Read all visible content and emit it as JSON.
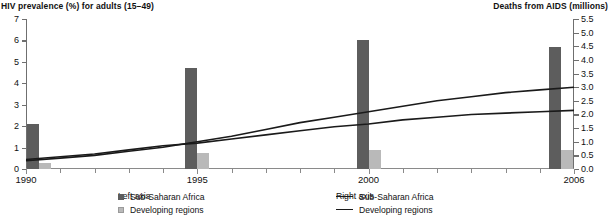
{
  "axes": {
    "left_title": "HIV prevalence (%) for adults (15–49)",
    "right_title": "Deaths from AIDS (millions)",
    "left_ticks": [
      "0",
      "1",
      "2",
      "3",
      "4",
      "5",
      "6",
      "7"
    ],
    "right_ticks": [
      "0.0",
      "0.5",
      "1.0",
      "1.5",
      "2.0",
      "2.5",
      "3.0",
      "3.5",
      "4.0",
      "4.5",
      "5.0",
      "5.5"
    ],
    "x_major_labels": [
      "1990",
      "1995",
      "2000",
      "2006"
    ]
  },
  "legend": {
    "left_heading": "Left axis",
    "right_heading": "Right axis",
    "left_items": [
      {
        "label": "Sub-Saharan Africa",
        "marker": "square-dark",
        "color": "#5d5d5d"
      },
      {
        "label": "Developing regions",
        "marker": "square-light",
        "color": "#b9b9b9"
      }
    ],
    "right_items": [
      {
        "label": "Sub-Saharan Africa",
        "marker": "line",
        "color": "#1a1a1a"
      },
      {
        "label": "Developing regions",
        "marker": "line",
        "color": "#1a1a1a"
      }
    ]
  },
  "chart_data": {
    "type": "bar",
    "title": "",
    "subtitle": "",
    "xlabel": "",
    "ylabel": "HIV prevalence (%) for adults (15–49)",
    "y2label": "Deaths from AIDS (millions)",
    "ylim": [
      0,
      7
    ],
    "y2lim": [
      0.0,
      5.5
    ],
    "grid": false,
    "legend_position": "bottom",
    "x_axis_range": [
      1990,
      2006
    ],
    "x_tick_years": [
      1990,
      1991,
      1992,
      1993,
      1994,
      1995,
      1996,
      1997,
      1998,
      1999,
      2000,
      2001,
      2002,
      2003,
      2004,
      2005,
      2006
    ],
    "x_labeled_years": [
      1990,
      1995,
      2000,
      2006
    ],
    "bar_categories": [
      1990,
      1995,
      2000,
      2006
    ],
    "series": [
      {
        "name": "Sub-Saharan Africa",
        "kind": "bar",
        "axis": "left",
        "unit": "HIV prevalence (%)",
        "color": "#5d5d5d",
        "categories": [
          1990,
          1995,
          2000,
          2006
        ],
        "values": [
          2.1,
          4.7,
          6.0,
          5.7
        ]
      },
      {
        "name": "Developing regions",
        "kind": "bar",
        "axis": "left",
        "unit": "HIV prevalence (%)",
        "color": "#b9b9b9",
        "categories": [
          1990,
          1995,
          2000,
          2006
        ],
        "values": [
          0.3,
          0.75,
          0.9,
          0.9
        ]
      },
      {
        "name": "Sub-Saharan Africa",
        "kind": "line",
        "axis": "right",
        "unit": "Deaths from AIDS (millions)",
        "color": "#1a1a1a",
        "x": [
          1990,
          1991,
          1992,
          1993,
          1994,
          1995,
          1996,
          1997,
          1998,
          1999,
          2000,
          2001,
          2002,
          2003,
          2004,
          2005,
          2006
        ],
        "values": [
          0.3,
          0.4,
          0.5,
          0.65,
          0.8,
          1.0,
          1.2,
          1.45,
          1.7,
          1.9,
          2.1,
          2.3,
          2.5,
          2.65,
          2.8,
          2.9,
          3.0
        ]
      },
      {
        "name": "Developing regions",
        "kind": "line",
        "axis": "right",
        "unit": "Deaths from AIDS (millions)",
        "color": "#1a1a1a",
        "x": [
          1990,
          1991,
          1992,
          1993,
          1994,
          1995,
          1996,
          1997,
          1998,
          1999,
          2000,
          2001,
          2002,
          2003,
          2004,
          2005,
          2006
        ],
        "values": [
          0.35,
          0.45,
          0.55,
          0.7,
          0.85,
          0.95,
          1.1,
          1.25,
          1.4,
          1.55,
          1.65,
          1.8,
          1.9,
          2.0,
          2.05,
          2.1,
          2.15
        ]
      }
    ]
  }
}
